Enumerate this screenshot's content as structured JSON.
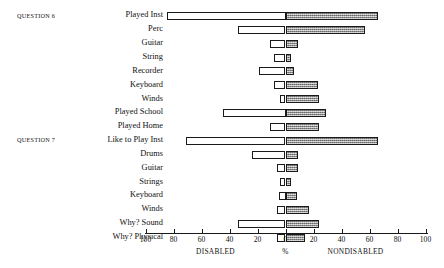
{
  "chart_data": {
    "type": "bar",
    "orientation": "horizontal-diverging",
    "title": "",
    "xlabel": "%",
    "ylabel": "",
    "xlim": [
      -100,
      100
    ],
    "grid": false,
    "axis": {
      "tick_values": [
        -100,
        -80,
        -60,
        -40,
        -20,
        0,
        20,
        40,
        60,
        80,
        100
      ],
      "tick_labels": [
        "100",
        "80",
        "60",
        "40",
        "20",
        "0",
        "20",
        "40",
        "60",
        "80",
        "100"
      ],
      "left_caption": "DISABLED",
      "center_caption": "%",
      "right_caption": "NONDISABLED"
    },
    "legend": [
      "DISABLED",
      "NONDISABLED"
    ],
    "legend_position": "below-axis",
    "colors": {
      "disabled": "#ffffff",
      "nondisabled": "#9a9a9a",
      "outline": "#1a1a1a"
    },
    "groups": [
      {
        "caption": "QUESTION 6",
        "first_row": 0
      },
      {
        "caption": "QUESTION 7",
        "first_row": 9
      }
    ],
    "series": [
      {
        "name": "DISABLED",
        "values": [
          85,
          34,
          11,
          8,
          19,
          8,
          4,
          45,
          11,
          71,
          24,
          6,
          4,
          5,
          6,
          34,
          6
        ]
      },
      {
        "name": "NONDISABLED",
        "values": [
          66,
          57,
          9,
          4,
          6,
          23,
          24,
          29,
          24,
          66,
          9,
          9,
          4,
          8,
          17,
          24,
          14
        ]
      }
    ],
    "categories": [
      "Played Inst",
      "Perc",
      "Guitar",
      "String",
      "Recorder",
      "Keyboard",
      "Winds",
      "Played School",
      "Played Home",
      "Like to Play Inst",
      "Drums",
      "Guitar",
      "Strings",
      "Keyboard",
      "Winds",
      "Why? Sound",
      "Why? Physical"
    ]
  }
}
